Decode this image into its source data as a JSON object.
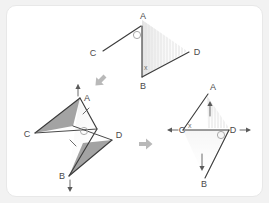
{
  "figure": {
    "type": "geometry-transformation-diagram",
    "background_color": "#f2f2f2",
    "card_color": "#ffffff",
    "line_color": "#3d3d3d",
    "shade_color": "#9b9b9b",
    "arrow_color": "#b9b9b9"
  },
  "panels": [
    {
      "id": "panel-top",
      "name": "original-figure",
      "vertices": [
        {
          "label": "A",
          "x": 141,
          "y": 19
        },
        {
          "label": "B",
          "x": 141,
          "y": 77
        },
        {
          "label": "C",
          "x": 97,
          "y": 50
        },
        {
          "label": "D",
          "x": 186,
          "y": 50
        }
      ],
      "angle_marks": [
        {
          "at": "A",
          "glyph": "circle"
        },
        {
          "at": "B",
          "glyph": "x"
        }
      ]
    },
    {
      "id": "panel-bottom-left",
      "name": "rotated-figure",
      "vertices": [
        {
          "label": "A",
          "x": 80,
          "y": 100
        },
        {
          "label": "B",
          "x": 68,
          "y": 174
        },
        {
          "label": "C",
          "x": 34,
          "y": 131
        },
        {
          "label": "D",
          "x": 110,
          "y": 139
        }
      ],
      "angle_marks": [
        {
          "at": "A",
          "glyph": "circle"
        },
        {
          "at": "B",
          "glyph": "x"
        }
      ],
      "direction_ticks": [
        {
          "at": "A",
          "direction": "up"
        },
        {
          "at": "B",
          "direction": "down"
        }
      ]
    },
    {
      "id": "panel-bottom-right",
      "name": "final-figure",
      "vertices": [
        {
          "label": "A",
          "x": 207,
          "y": 95
        },
        {
          "label": "B",
          "x": 207,
          "y": 179
        },
        {
          "label": "C",
          "x": 178,
          "y": 128
        },
        {
          "label": "D",
          "x": 234,
          "y": 128
        }
      ],
      "angle_marks": [
        {
          "at": "C",
          "glyph": "x"
        },
        {
          "at": "D",
          "glyph": "circle"
        }
      ],
      "direction_ticks": [
        {
          "at": "C",
          "direction": "left"
        },
        {
          "at": "D",
          "direction": "right"
        },
        {
          "at": "A",
          "direction": "up"
        },
        {
          "at": "B",
          "direction": "down"
        }
      ]
    }
  ],
  "motion_arrows": [
    {
      "id": "arrow-down-left",
      "direction": "down-left",
      "x": 104,
      "y": 76
    },
    {
      "id": "arrow-right",
      "direction": "right",
      "x": 143,
      "y": 143
    }
  ],
  "labels": {
    "A": "A",
    "B": "B",
    "C": "C",
    "D": "D",
    "x_mark": "x"
  }
}
